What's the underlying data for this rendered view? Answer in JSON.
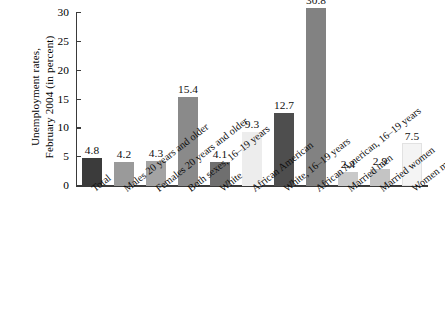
{
  "chart_data": {
    "type": "bar",
    "title": "",
    "subtitle": "",
    "xlabel": "",
    "ylabel": "Unemployment rates, February 2004 (in percent)",
    "ylabel_lines": [
      "Unemployment rates,",
      "February 2004 (in percent)"
    ],
    "ylim": [
      0,
      30
    ],
    "yticks": [
      0,
      5,
      10,
      15,
      20,
      25,
      30
    ],
    "ytick_labels": [
      "0",
      "5",
      "10",
      "15",
      "20",
      "25",
      "30"
    ],
    "grid": false,
    "legend": false,
    "legend_position": "none",
    "categories": [
      "Total",
      "Males 20 years and older",
      "Females 20 years and older",
      "Both sexes, 16–19 years",
      "White",
      "African American",
      "White, 16–19 years",
      "African American, 16–19 years",
      "Married men",
      "Married women",
      "Women maintaining families"
    ],
    "values": [
      4.8,
      4.2,
      4.3,
      15.4,
      4.1,
      9.3,
      12.7,
      30.8,
      2.4,
      2.9,
      7.5
    ],
    "value_labels": [
      "4.8",
      "4.2",
      "4.3",
      "15.4",
      "4.1",
      "9.3",
      "12.7",
      "30.8",
      "2.4",
      "2.9",
      "7.5"
    ],
    "bar_colors": [
      "#3b3b3b",
      "#9a9a9a",
      "#a3a3a3",
      "#8a8a8a",
      "#6f6f6f",
      "#ededed",
      "#4e4e4e",
      "#828282",
      "#c9c9c9",
      "#c4c4c4",
      "#f4f4f4"
    ]
  }
}
